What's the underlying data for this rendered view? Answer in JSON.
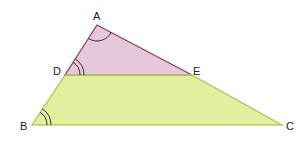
{
  "figure": {
    "colors": {
      "top_triangle_fill": "#e6c8dc",
      "top_triangle_stroke": "#8c3a5e",
      "trapezoid_fill": "#e3ef9e",
      "trapezoid_stroke": "#b5d070",
      "angle_arc": "#333333"
    },
    "points": {
      "A": "A",
      "B": "B",
      "C": "C",
      "D": "D",
      "E": "E"
    },
    "angle_marks": [
      {
        "vertex": "A",
        "arcs": 1
      },
      {
        "vertex": "D",
        "arcs": 2
      },
      {
        "vertex": "B",
        "arcs": 2
      }
    ]
  }
}
